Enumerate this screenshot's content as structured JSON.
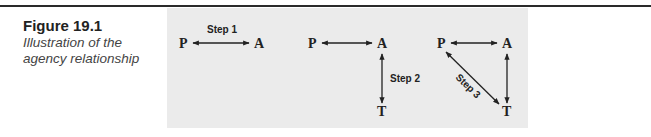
{
  "figure": {
    "label": "Figure 19.1",
    "description_line1": "Illustration of the",
    "description_line2": "agency relationship"
  },
  "diagram": {
    "nodes": {
      "principal": "P",
      "agent": "A",
      "third_party": "T"
    },
    "panels": [
      {
        "step_label": "Step 1",
        "links": [
          "P-A"
        ]
      },
      {
        "step_label": "Step 2",
        "links": [
          "P-A",
          "A-T"
        ]
      },
      {
        "step_label": "Step 3",
        "links": [
          "P-A",
          "A-T",
          "P-T"
        ]
      }
    ]
  }
}
